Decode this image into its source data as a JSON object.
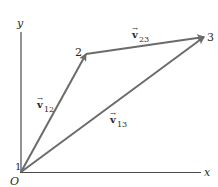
{
  "diagram": {
    "type": "vector-displacement",
    "axes": {
      "x_label": "x",
      "y_label": "y",
      "origin_label": "O"
    },
    "points": [
      {
        "id": "1",
        "label": "1",
        "x": 21,
        "y": 172
      },
      {
        "id": "2",
        "label": "2",
        "x": 86,
        "y": 54
      },
      {
        "id": "3",
        "label": "3",
        "x": 204,
        "y": 37
      }
    ],
    "vectors": [
      {
        "id": "v12",
        "from": "1",
        "to": "2",
        "symbol": "v",
        "subscript": "12"
      },
      {
        "id": "v23",
        "from": "2",
        "to": "3",
        "symbol": "v",
        "subscript": "23"
      },
      {
        "id": "v13",
        "from": "1",
        "to": "3",
        "symbol": "v",
        "subscript": "13"
      }
    ],
    "colors": {
      "vector": "#6b6b6b",
      "axis": "#4a4a4a",
      "text": "#2a2a2a"
    }
  }
}
